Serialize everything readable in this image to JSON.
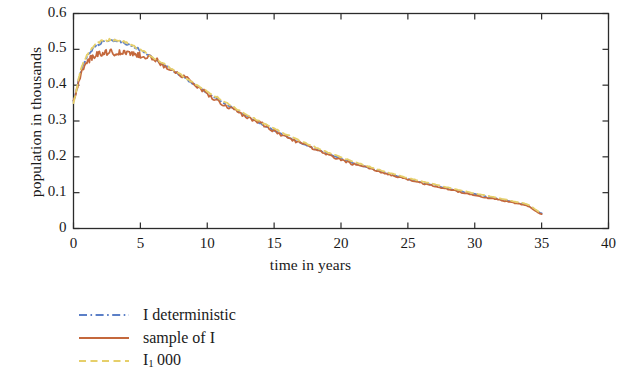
{
  "chart_data": {
    "type": "line",
    "title": "",
    "xlabel": "time in years",
    "ylabel": "population in thousands",
    "xlim": [
      0,
      40
    ],
    "ylim": [
      0,
      0.6
    ],
    "xticks": [
      "0",
      "5",
      "10",
      "15",
      "20",
      "25",
      "30",
      "35",
      "40"
    ],
    "xtick_values": [
      0,
      5,
      10,
      15,
      20,
      25,
      30,
      35,
      40
    ],
    "yticks": [
      "0",
      "0.1",
      "0.2",
      "0.3",
      "0.4",
      "0.5",
      "0.6"
    ],
    "ytick_values": [
      0,
      0.1,
      0.2,
      0.3,
      0.4,
      0.5,
      0.6
    ],
    "grid": false,
    "frame": "box-all-sides-inward-ticks",
    "legend_position": "below-plot-left",
    "x": [
      0,
      0.5,
      1,
      1.5,
      2,
      2.5,
      3,
      3.5,
      4,
      4.5,
      5,
      6,
      7,
      8,
      9,
      10,
      11,
      12,
      13,
      14,
      15,
      16,
      17,
      18,
      19,
      20,
      21,
      22,
      23,
      24,
      25,
      26,
      27,
      28,
      29,
      30,
      31,
      32,
      33,
      34,
      35
    ],
    "series": [
      {
        "name": "I deterministic",
        "color": "#5b7fc7",
        "style": "dashdot",
        "values": [
          0.355,
          0.432,
          0.478,
          0.503,
          0.517,
          0.523,
          0.524,
          0.521,
          0.515,
          0.507,
          0.497,
          0.475,
          0.451,
          0.427,
          0.403,
          0.379,
          0.356,
          0.334,
          0.313,
          0.293,
          0.274,
          0.256,
          0.239,
          0.223,
          0.209,
          0.195,
          0.182,
          0.17,
          0.159,
          0.148,
          0.138,
          0.129,
          0.12,
          0.111,
          0.103,
          0.096,
          0.088,
          0.081,
          0.073,
          0.064,
          0.042
        ]
      },
      {
        "name": "sample of I",
        "color": "#c4683c",
        "style": "solid",
        "values": [
          0.357,
          0.425,
          0.462,
          0.481,
          0.489,
          0.492,
          0.491,
          0.49,
          0.489,
          0.487,
          0.484,
          0.474,
          0.45,
          0.429,
          0.403,
          0.375,
          0.352,
          0.33,
          0.31,
          0.294,
          0.272,
          0.254,
          0.238,
          0.222,
          0.205,
          0.192,
          0.179,
          0.169,
          0.157,
          0.147,
          0.137,
          0.127,
          0.118,
          0.11,
          0.101,
          0.093,
          0.085,
          0.079,
          0.071,
          0.062,
          0.04
        ]
      },
      {
        "name": "I₁ 000",
        "color": "#e6cf6a",
        "style": "dashed",
        "values": [
          0.352,
          0.436,
          0.483,
          0.508,
          0.521,
          0.526,
          0.526,
          0.523,
          0.517,
          0.508,
          0.498,
          0.477,
          0.453,
          0.43,
          0.406,
          0.383,
          0.36,
          0.338,
          0.317,
          0.297,
          0.279,
          0.261,
          0.244,
          0.228,
          0.213,
          0.199,
          0.186,
          0.174,
          0.162,
          0.151,
          0.141,
          0.132,
          0.123,
          0.114,
          0.106,
          0.098,
          0.091,
          0.083,
          0.075,
          0.066,
          0.043
        ]
      }
    ]
  },
  "legend": {
    "items": [
      {
        "label": "I deterministic",
        "sub": "",
        "tail": ""
      },
      {
        "label": "sample of I",
        "sub": "",
        "tail": ""
      },
      {
        "label": "I",
        "sub": "1",
        "tail": "000"
      }
    ]
  }
}
